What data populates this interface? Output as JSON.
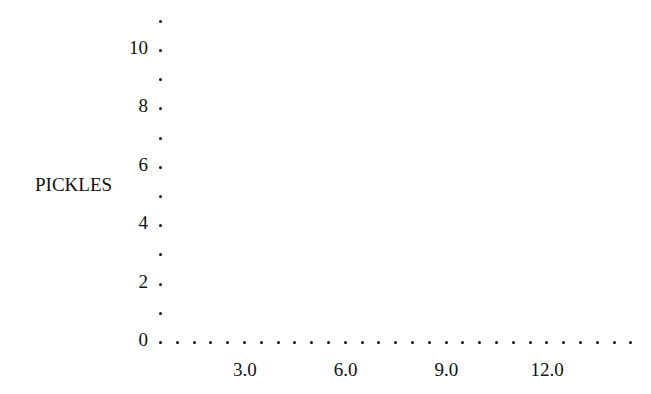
{
  "chart_data": {
    "type": "scatter",
    "title": "",
    "xlabel": "",
    "ylabel": "PICKLES",
    "x_ticks": [
      "3.0",
      "6.0",
      "9.0",
      "12.0"
    ],
    "x_tick_values": [
      3.0,
      6.0,
      9.0,
      12.0
    ],
    "y_ticks": [
      "0",
      "2",
      "4",
      "6",
      "8",
      "10"
    ],
    "y_tick_values": [
      0,
      2,
      4,
      6,
      8,
      10
    ],
    "xlim": [
      0,
      14.7
    ],
    "ylim": [
      0,
      11
    ],
    "grid": false,
    "axis_style": "dotted",
    "series": [
      {
        "name": "PICKLES",
        "x": [],
        "y": []
      }
    ]
  },
  "layout": {
    "origin_x": 160,
    "origin_y": 342,
    "x_dot_spacing": 16.8,
    "x_dot_count": 28,
    "y_dot_spacing": 29.2,
    "y_dot_count": 12,
    "x_units_per_dot": 0.5,
    "y_units_per_dot": 1
  }
}
